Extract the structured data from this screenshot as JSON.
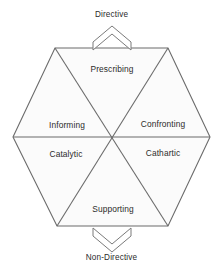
{
  "diagram": {
    "type": "six-category-intervention-hexagon",
    "poles": {
      "top": {
        "label": "Directive",
        "arrow": "chevron-up"
      },
      "bottom": {
        "label": "Non-Directive",
        "arrow": "chevron-down"
      }
    },
    "segments": [
      {
        "id": "prescribing",
        "label": "Prescribing",
        "position": "top"
      },
      {
        "id": "informing",
        "label": "Informing",
        "position": "upper-left"
      },
      {
        "id": "confronting",
        "label": "Confronting",
        "position": "upper-right"
      },
      {
        "id": "catalytic",
        "label": "Catalytic",
        "position": "lower-left"
      },
      {
        "id": "cathartic",
        "label": "Cathartic",
        "position": "lower-right"
      },
      {
        "id": "supporting",
        "label": "Supporting",
        "position": "bottom"
      }
    ],
    "style": {
      "background": "#ffffff",
      "fill": "#fbfbfb",
      "stroke": "#6b6b6b",
      "text": "#2b2b2b"
    },
    "geometry": {
      "hexagon_vertices": [
        [
          55,
          48
        ],
        [
          168,
          48
        ],
        [
          210,
          137
        ],
        [
          168,
          226
        ],
        [
          57,
          226
        ],
        [
          13,
          137
        ]
      ],
      "center": [
        112,
        137
      ]
    }
  }
}
